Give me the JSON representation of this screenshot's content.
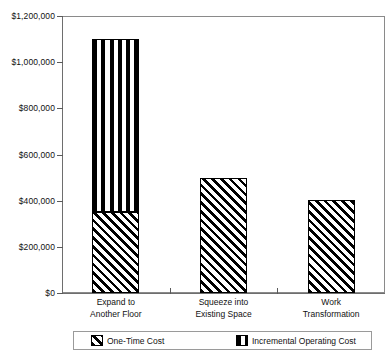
{
  "chart_data": {
    "type": "bar",
    "stacked": true,
    "title": "",
    "xlabel": "",
    "ylabel": "",
    "categories": [
      "Expand to Another Floor",
      "Squeeze into Existing Space",
      "Work Transformation"
    ],
    "category_lines": [
      [
        "Expand to",
        "Another Floor"
      ],
      [
        "Squeeze into",
        "Existing Space"
      ],
      [
        "Work",
        "Transformation"
      ]
    ],
    "series": [
      {
        "name": "One-Time Cost",
        "pattern": "diagonal-hatch",
        "values": [
          350000,
          500000,
          405000
        ]
      },
      {
        "name": "Incremental Operating Cost",
        "pattern": "vertical-stripes",
        "values": [
          750000,
          0,
          0
        ]
      }
    ],
    "totals": [
      1100000,
      500000,
      405000
    ],
    "ylim": [
      0,
      1200000
    ],
    "ytick_values": [
      0,
      200000,
      400000,
      600000,
      800000,
      1000000,
      1200000
    ],
    "ytick_labels": [
      "$0",
      "$200,000",
      "$400,000",
      "$600,000",
      "$800,000",
      "$1,000,000",
      "$1,200,000"
    ],
    "grid": false,
    "legend_position": "bottom",
    "colors": {
      "ink": "#000000",
      "axis": "#6e6e6e",
      "frame": "#8a8a8a",
      "background": "#ffffff"
    }
  }
}
